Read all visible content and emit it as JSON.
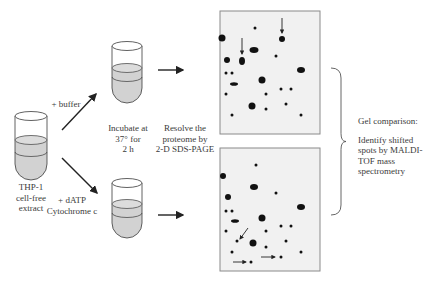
{
  "labels": {
    "start_tube": [
      "THP-1",
      "cell-free",
      "extract"
    ],
    "buffer": "+ buffer",
    "datp": [
      "+ dATP",
      "Cytochrome c"
    ],
    "incubate": [
      "Incubate at",
      "37° for",
      "2 h"
    ],
    "resolve": [
      "Resolve the",
      "proteome by",
      "2-D SDS-PAGE"
    ],
    "gel_comparison": "Gel comparison:",
    "identify": [
      "Identify shifted",
      "spots by MALDI-",
      "TOF mass",
      "spectrometry"
    ]
  },
  "colors": {
    "liquid": "#d2d2d2",
    "gel_bg": "#f1f1f1",
    "gel_border": "#8a8a8a",
    "spot": "#111111",
    "line": "#3a3a3a"
  },
  "gels": [
    {
      "name": "control-gel",
      "x": 220,
      "y": 11,
      "w": 100,
      "h": 123,
      "spots": [
        [
          222,
          38,
          3.5,
          3.5
        ],
        [
          255,
          28,
          1.5,
          1.5
        ],
        [
          282,
          39,
          3,
          3
        ],
        [
          254,
          50,
          4.5,
          3
        ],
        [
          276,
          56,
          1.5,
          1.5
        ],
        [
          227,
          60,
          3,
          3
        ],
        [
          242,
          61,
          3,
          4
        ],
        [
          301,
          70,
          4,
          3
        ],
        [
          226,
          73,
          1.5,
          1.5
        ],
        [
          232,
          73,
          1.5,
          1.5
        ],
        [
          234,
          84,
          4,
          1.8
        ],
        [
          262,
          80,
          3.5,
          3.5
        ],
        [
          281,
          89,
          1.5,
          1.5
        ],
        [
          291,
          89,
          1.5,
          1.5
        ],
        [
          226,
          94,
          1.5,
          1.5
        ],
        [
          266,
          94,
          1.5,
          1.5
        ],
        [
          252,
          106,
          3.5,
          3.5
        ],
        [
          266,
          109,
          1.5,
          1.5
        ],
        [
          286,
          104,
          1.5,
          1.5
        ],
        [
          232,
          115,
          1.5,
          1.5
        ],
        [
          301,
          115,
          1.5,
          1.5
        ]
      ],
      "arrows": [
        {
          "x1": 242,
          "y1": 38,
          "x2": 242,
          "y2": 54
        },
        {
          "x1": 282,
          "y1": 18,
          "x2": 282,
          "y2": 33
        }
      ]
    },
    {
      "name": "treated-gel",
      "x": 220,
      "y": 148,
      "w": 100,
      "h": 123,
      "spots": [
        [
          256,
          165,
          1.5,
          1.5
        ],
        [
          223,
          176,
          3,
          3
        ],
        [
          254,
          187,
          4,
          3
        ],
        [
          276,
          193,
          1.5,
          1.5
        ],
        [
          228,
          197,
          3,
          3
        ],
        [
          226,
          211,
          1.5,
          1.5
        ],
        [
          232,
          211,
          1.5,
          1.5
        ],
        [
          301,
          207,
          4,
          3
        ],
        [
          235,
          221,
          4,
          1.8
        ],
        [
          262,
          218,
          3.5,
          3.5
        ],
        [
          226,
          231,
          1.5,
          1.5
        ],
        [
          266,
          231,
          1.5,
          1.5
        ],
        [
          281,
          226,
          1.5,
          1.5
        ],
        [
          291,
          226,
          1.5,
          1.5
        ],
        [
          237,
          241,
          1.5,
          1.5
        ],
        [
          253,
          243,
          3.5,
          3.5
        ],
        [
          266,
          247,
          1.5,
          1.5
        ],
        [
          286,
          241,
          1.5,
          1.5
        ],
        [
          232,
          252,
          1.5,
          1.5
        ],
        [
          301,
          252,
          1.5,
          1.5
        ],
        [
          251,
          262,
          1.5,
          1.5
        ],
        [
          281,
          257,
          1.5,
          1.5
        ]
      ],
      "arrows": [
        {
          "x1": 248,
          "y1": 228,
          "x2": 240,
          "y2": 239
        },
        {
          "x1": 233,
          "y1": 262,
          "x2": 246,
          "y2": 262
        },
        {
          "x1": 261,
          "y1": 257,
          "x2": 275,
          "y2": 257
        }
      ]
    }
  ],
  "tubes": [
    {
      "name": "extract-tube",
      "cx": 31,
      "top": 116,
      "rx": 16,
      "body": 48,
      "liquid": 140,
      "band": 152
    },
    {
      "name": "buffer-tube",
      "cx": 127,
      "top": 46,
      "rx": 15,
      "body": 42,
      "liquid": 68,
      "band": 77
    },
    {
      "name": "datp-tube",
      "cx": 127,
      "top": 183,
      "rx": 15,
      "body": 40,
      "liquid": 204,
      "band": 213
    }
  ],
  "flow_arrows": [
    {
      "name": "buffer-arrow",
      "x1": 62,
      "y1": 130,
      "x2": 96,
      "y2": 94
    },
    {
      "name": "datp-arrow",
      "x1": 62,
      "y1": 158,
      "x2": 97,
      "y2": 193
    },
    {
      "name": "resolve-arrow-top",
      "x1": 158,
      "y1": 70,
      "x2": 183,
      "y2": 70
    },
    {
      "name": "resolve-arrow-bottom",
      "x1": 158,
      "y1": 215,
      "x2": 183,
      "y2": 215
    }
  ],
  "brace": {
    "x": 331,
    "y1": 68,
    "y2": 215,
    "tip": 346
  }
}
